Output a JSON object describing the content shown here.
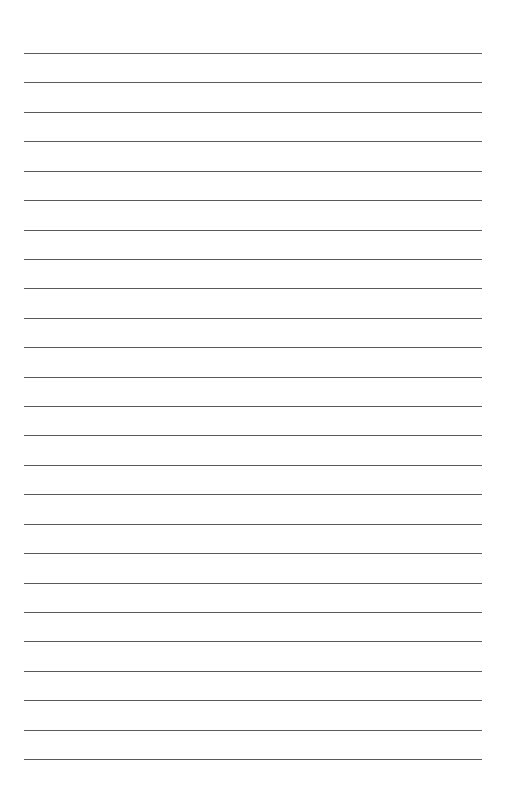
{
  "page": {
    "type": "blank-lined-sheet",
    "background_color": "#ffffff",
    "line_color": "#5a5a5a",
    "line_count": 25,
    "first_line_y": 53,
    "line_spacing": 29.42,
    "line_left": 24,
    "line_right": 482,
    "text": ""
  }
}
